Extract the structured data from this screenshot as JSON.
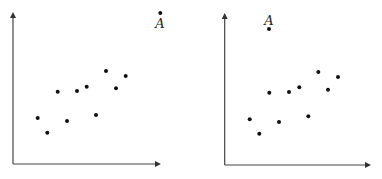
{
  "chart_data": [
    {
      "type": "scatter",
      "title": "",
      "xlabel": "",
      "ylabel": "",
      "grid": false,
      "points_px": [
        [
          37.7,
          118
        ],
        [
          47.3,
          132.7
        ],
        [
          57.7,
          91.7
        ],
        [
          67,
          121
        ],
        [
          77,
          91
        ],
        [
          86.7,
          86.7
        ],
        [
          96,
          115
        ],
        [
          106,
          71
        ],
        [
          116,
          88.3
        ],
        [
          125.7,
          76
        ]
      ],
      "outlier": {
        "label": "A",
        "px": [
          160.3,
          13
        ],
        "label_px": [
          160,
          28
        ]
      },
      "axes": {
        "origin_px": [
          13,
          164
        ],
        "x_end_px": 161,
        "y_top_px": 12
      }
    },
    {
      "type": "scatter",
      "title": "",
      "xlabel": "",
      "ylabel": "",
      "grid": false,
      "points_px": [
        [
          249.7,
          119.3
        ],
        [
          259.3,
          133.7
        ],
        [
          269.3,
          92.7
        ],
        [
          279,
          122
        ],
        [
          289,
          92
        ],
        [
          299.3,
          87.3
        ],
        [
          308.3,
          116.3
        ],
        [
          318.3,
          72
        ],
        [
          328,
          89.7
        ],
        [
          338,
          77
        ]
      ],
      "outlier": {
        "label": "A",
        "px": [
          269,
          29
        ],
        "label_px": [
          269,
          25
        ]
      },
      "axes": {
        "origin_px": [
          224.7,
          165
        ],
        "x_end_px": 371,
        "y_top_px": 13
      }
    }
  ]
}
